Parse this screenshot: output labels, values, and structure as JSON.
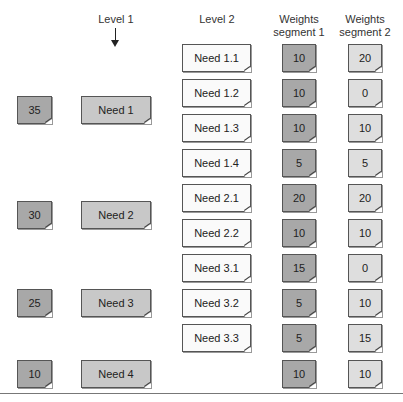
{
  "headers": {
    "level1": "Level 1",
    "level2": "Level 2",
    "seg1_line1": "Weights",
    "seg1_line2": "segment 1",
    "seg2_line1": "Weights",
    "seg2_line2": "segment 2"
  },
  "level1": [
    {
      "weight": "35",
      "label": "Need 1"
    },
    {
      "weight": "30",
      "label": "Need 2"
    },
    {
      "weight": "25",
      "label": "Need 3"
    },
    {
      "weight": "10",
      "label": "Need 4"
    }
  ],
  "level2": [
    {
      "label": "Need 1.1",
      "seg1": "10",
      "seg2": "20"
    },
    {
      "label": "Need 1.2",
      "seg1": "10",
      "seg2": "0"
    },
    {
      "label": "Need 1.3",
      "seg1": "10",
      "seg2": "10"
    },
    {
      "label": "Need 1.4",
      "seg1": "5",
      "seg2": "5"
    },
    {
      "label": "Need 2.1",
      "seg1": "20",
      "seg2": "20"
    },
    {
      "label": "Need 2.2",
      "seg1": "10",
      "seg2": "10"
    },
    {
      "label": "Need 3.1",
      "seg1": "15",
      "seg2": "0"
    },
    {
      "label": "Need 3.2",
      "seg1": "5",
      "seg2": "10"
    },
    {
      "label": "Need 3.3",
      "seg1": "5",
      "seg2": "15"
    },
    {
      "label": "",
      "seg1": "10",
      "seg2": "10"
    }
  ],
  "colors": {
    "weight_level1": "#a8a8a8",
    "need_level1": "#c8c8c8",
    "need_level2": "#fafafa",
    "seg1": "#a8a8a8",
    "seg2": "#dedede"
  }
}
